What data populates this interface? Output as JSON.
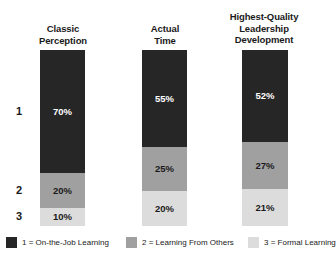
{
  "chart_data": {
    "type": "bar",
    "title": "",
    "subtitle": "",
    "xlabel": "",
    "ylabel": "",
    "stacked": true,
    "orientation": "vertical",
    "normalized_percent": true,
    "ylim": [
      0,
      100
    ],
    "grid": false,
    "legend_position": "bottom",
    "categories": [
      "Classic Perception",
      "Actual Time",
      "Highest-Quality Leadership Development"
    ],
    "category_display": [
      [
        "Classic",
        "Perception"
      ],
      [
        "Actual",
        "Time"
      ],
      [
        "Highest-Quality",
        "Leadership",
        "Development"
      ]
    ],
    "series": [
      {
        "name": "1 = On-the-Job Learning",
        "short_name": "On-the-Job Learning",
        "key": "1",
        "color": "#262626",
        "label_color": "#ffffff",
        "values": [
          70,
          20,
          10
        ],
        "value_labels": [
          "70%",
          "20%",
          "10%"
        ]
      },
      {
        "name": "2 = Learning From Others",
        "short_name": "Learning From Others",
        "key": "2",
        "color": "#a0a0a0",
        "label_color": "#1a1a1a",
        "values": [
          25,
          55,
          25
        ],
        "value_labels": [
          "25%",
          "55%",
          "25%"
        ]
      },
      {
        "name": "3 = Formal Learning",
        "short_name": "Formal Learning",
        "key": "3",
        "color": "#dcdcdc",
        "label_color": "#1a1a1a",
        "values": [
          52,
          27,
          21
        ],
        "value_labels": [
          "52%",
          "27%",
          "21%"
        ]
      }
    ],
    "columns": [
      {
        "label_lines": [
          "Classic",
          "Perception"
        ],
        "segments": [
          {
            "key": "1",
            "value": 70,
            "label": "70%",
            "color": "#262626",
            "label_color": "#ffffff"
          },
          {
            "key": "2",
            "value": 20,
            "label": "20%",
            "color": "#a0a0a0",
            "label_color": "#1a1a1a"
          },
          {
            "key": "3",
            "value": 10,
            "label": "10%",
            "color": "#dcdcdc",
            "label_color": "#1a1a1a"
          }
        ]
      },
      {
        "label_lines": [
          "Actual",
          "Time"
        ],
        "segments": [
          {
            "key": "1",
            "value": 55,
            "label": "55%",
            "color": "#262626",
            "label_color": "#ffffff"
          },
          {
            "key": "2",
            "value": 25,
            "label": "25%",
            "color": "#a0a0a0",
            "label_color": "#1a1a1a"
          },
          {
            "key": "3",
            "value": 20,
            "label": "20%",
            "color": "#dcdcdc",
            "label_color": "#1a1a1a"
          }
        ]
      },
      {
        "label_lines": [
          "Highest-Quality",
          "Leadership",
          "Development"
        ],
        "segments": [
          {
            "key": "1",
            "value": 52,
            "label": "52%",
            "color": "#262626",
            "label_color": "#ffffff"
          },
          {
            "key": "2",
            "value": 27,
            "label": "27%",
            "color": "#a0a0a0",
            "label_color": "#1a1a1a"
          },
          {
            "key": "3",
            "value": 21,
            "label": "21%",
            "color": "#dcdcdc",
            "label_color": "#1a1a1a"
          }
        ]
      }
    ],
    "row_labels": [
      "1",
      "2",
      "3"
    ],
    "legend": [
      {
        "label": "1 = On-the-Job Learning",
        "color": "#262626"
      },
      {
        "label": "2 = Learning From Others",
        "color": "#a0a0a0"
      },
      {
        "label": "3 = Formal Learning",
        "color": "#dcdcdc"
      }
    ]
  },
  "colors": {
    "background": "#ffffff",
    "text": "#1a1a1a",
    "series_1": "#262626",
    "series_2": "#a0a0a0",
    "series_3": "#dcdcdc"
  }
}
